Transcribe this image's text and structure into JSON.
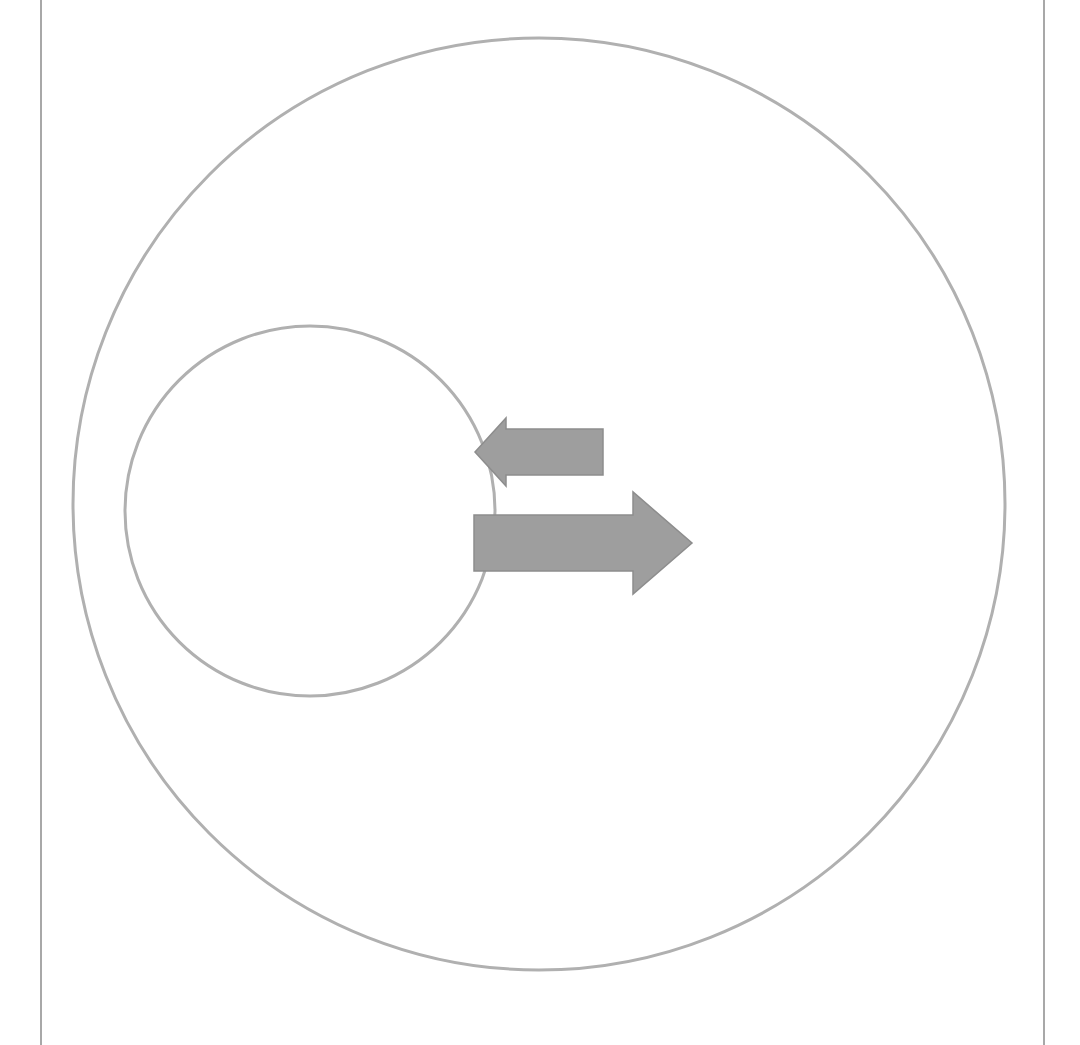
{
  "page": {
    "width": 1080,
    "height": 1045,
    "background_color": "#ffffff"
  },
  "colors": {
    "outline_stroke": "#b0b0b0",
    "arrow_fill": "#9e9e9e",
    "arrow_stroke": "#8d8d8d",
    "border_rule": "#a8a8a8",
    "background": "#ffffff"
  },
  "page_rules": {
    "left_rule": {
      "name": "left-margin-rule",
      "x": 41,
      "y_top": 0,
      "y_bottom": 1045,
      "width": 2
    },
    "right_rule": {
      "name": "right-margin-rule",
      "x": 1044,
      "y_top": 0,
      "y_bottom": 1045,
      "width": 2
    }
  },
  "shapes": {
    "outer_circle": {
      "label": "outer-circle",
      "cx": 539,
      "cy": 504,
      "r": 466,
      "stroke_width": 3,
      "fill": "none"
    },
    "inner_circle": {
      "label": "inner-circle",
      "cx": 310,
      "cy": 511,
      "r": 185,
      "stroke_width": 3,
      "fill": "none"
    }
  },
  "arrows": [
    {
      "label": "left-arrow",
      "direction": "left",
      "tip_x": 475,
      "tip_y": 452,
      "head_base_x": 506,
      "head_top_y": 418,
      "head_bottom_y": 486,
      "shaft_end_x": 603,
      "shaft_top_y": 429,
      "shaft_bottom_y": 475
    },
    {
      "label": "right-arrow",
      "direction": "right",
      "tip_x": 692,
      "tip_y": 543,
      "head_base_x": 633,
      "head_top_y": 492,
      "head_bottom_y": 594,
      "shaft_start_x": 474,
      "shaft_top_y": 515,
      "shaft_bottom_y": 571
    }
  ]
}
